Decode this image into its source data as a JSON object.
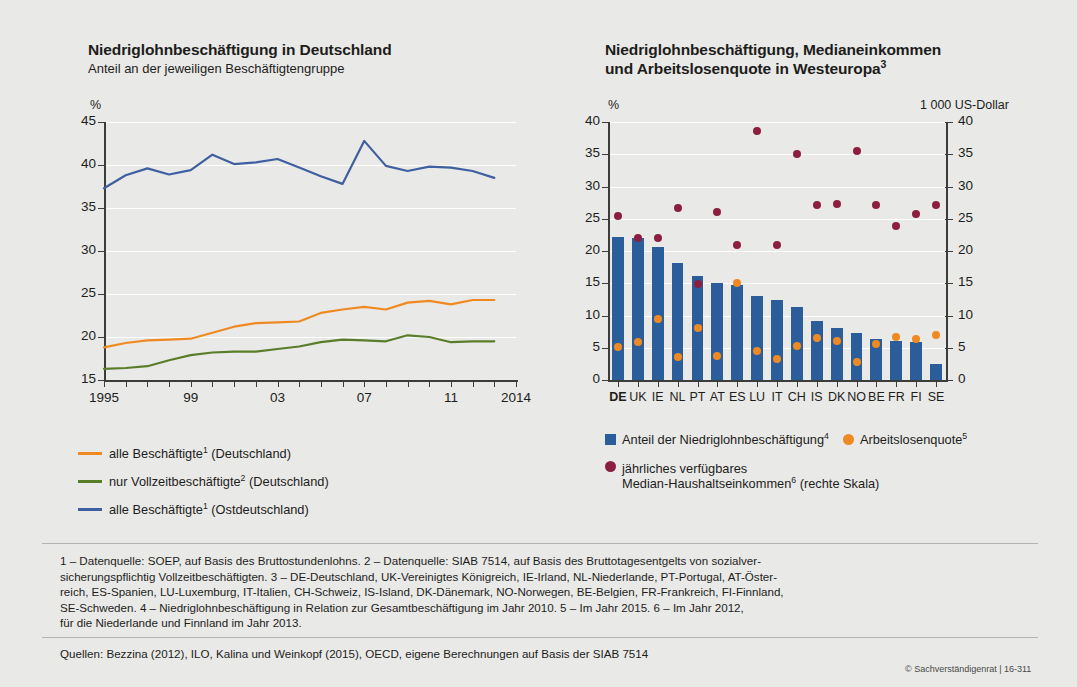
{
  "left_chart": {
    "title": "Niedriglohnbeschäftigung in Deutschland",
    "subtitle": "Anteil an der jeweiligen Beschäftigtengruppe",
    "unit": "%",
    "legend": [
      {
        "label_pre": "alle Beschäftigte",
        "sup": "1",
        "label_post": " (Deutschland)",
        "color": "#ef8a22"
      },
      {
        "label_pre": "nur Vollzeitbeschäftigte",
        "sup": "2",
        "label_post": " (Deutschland)",
        "color": "#5a7d2a"
      },
      {
        "label_pre": "alle Beschäftigte",
        "sup": "1",
        "label_post": " (Ostdeutschland)",
        "color": "#3f5fa0"
      }
    ]
  },
  "right_chart": {
    "title_line1": "Niedriglohnbeschäftigung, Medianeinkommen",
    "title_line2_pre": "und Arbeitslosenquote in Westeuropa",
    "title_line2_sup": "3",
    "unit_left": "%",
    "unit_right": "1 000 US-Dollar",
    "legend": [
      {
        "label_pre": "Anteil der Niedriglohnbeschäftigung",
        "sup": "4",
        "label_post": "",
        "color": "#2c5d9b",
        "shape": "square"
      },
      {
        "label_pre": "Arbeitslosenquote",
        "sup": "5",
        "label_post": "",
        "color": "#ef8a22",
        "shape": "dot"
      },
      {
        "label_pre": "jährliches verfügbares",
        "label_line2_pre": "Median-Haushaltseinkommen",
        "sup": "6",
        "label_post": " (rechte Skala)",
        "color": "#8c1f3f",
        "shape": "dot"
      }
    ]
  },
  "footnotes": [
    "1 – Datenquelle: SOEP, auf Basis des Bruttostundenlohns.  2 – Datenquelle: SIAB 7514, auf Basis des Bruttotagesentgelts von sozialver-",
    "sicherungspflichtig Vollzeitbeschäftigten.  3 – DE-Deutschland, UK-Vereinigtes Königreich, IE-Irland, NL-Niederlande, PT-Portugal, AT-Öster-",
    "reich, ES-Spanien, LU-Luxemburg, IT-Italien, CH-Schweiz,  IS-Island, DK-Dänemark, NO-Norwegen, BE-Belgien, FR-Frankreich, FI-Finnland,",
    "SE-Schweden.  4 – Niedriglohnbeschäftigung in Relation zur Gesamtbeschäftigung im Jahr 2010.  5 – Im Jahr 2015.  6 – Im Jahr 2012,",
    "für die Niederlande und Finnland im Jahr 2013."
  ],
  "sources": "Quellen: Bezzina (2012), ILO, Kalina und Weinkopf (2015), OECD, eigene Berechnungen auf Basis der SIAB 7514",
  "copyright": "© Sachverständigenrat | 16-311",
  "chart_data": [
    {
      "id": "left",
      "type": "line",
      "title": "Niedriglohnbeschäftigung in Deutschland",
      "subtitle": "Anteil an der jeweiligen Beschäftigtengruppe",
      "xlabel": "",
      "ylabel": "%",
      "ylim": [
        15,
        45
      ],
      "yticks": [
        15,
        20,
        25,
        30,
        35,
        40,
        45
      ],
      "grid": true,
      "legend_position": "below",
      "x": [
        1995,
        1996,
        1997,
        1998,
        1999,
        2000,
        2001,
        2002,
        2003,
        2004,
        2005,
        2006,
        2007,
        2008,
        2009,
        2010,
        2011,
        2012,
        2013
      ],
      "xticklabels": {
        "1995": "1995",
        "1999": "99",
        "2003": "03",
        "2007": "07",
        "2011": "11",
        "2014": "2014"
      },
      "series": [
        {
          "name": "alle Beschäftigte (Deutschland)",
          "color": "#ef8a22",
          "values": [
            18.8,
            19.3,
            19.6,
            19.7,
            19.8,
            20.5,
            21.2,
            21.6,
            21.7,
            21.8,
            22.8,
            23.2,
            23.5,
            23.2,
            24.0,
            24.2,
            23.8,
            24.3,
            24.3
          ]
        },
        {
          "name": "nur Vollzeitbeschäftigte (Deutschland)",
          "color": "#5a7d2a",
          "values": [
            16.3,
            16.4,
            16.6,
            17.3,
            17.9,
            18.2,
            18.3,
            18.3,
            18.6,
            18.9,
            19.4,
            19.7,
            19.6,
            19.5,
            20.2,
            20.0,
            19.4,
            19.5,
            19.5
          ]
        },
        {
          "name": "alle Beschäftigte (Ostdeutschland)",
          "color": "#3f5fa0",
          "values": [
            37.3,
            38.8,
            39.6,
            38.9,
            39.4,
            41.2,
            40.1,
            40.3,
            40.7,
            39.7,
            38.7,
            37.8,
            42.8,
            39.9,
            39.3,
            39.8,
            39.7,
            39.3,
            38.5
          ]
        }
      ]
    },
    {
      "id": "right",
      "type": "bar",
      "title": "Niedriglohnbeschäftigung, Medianeinkommen und Arbeitslosenquote in Westeuropa",
      "ylabel_left": "%",
      "ylabel_right": "1 000 US-Dollar",
      "ylim": [
        0,
        40
      ],
      "yticks": [
        0,
        5,
        10,
        15,
        20,
        25,
        30,
        35,
        40
      ],
      "ylim_right": [
        0,
        40
      ],
      "yticks_right": [
        0,
        5,
        10,
        15,
        20,
        25,
        30,
        35,
        40
      ],
      "grid": true,
      "legend_position": "below",
      "categories": [
        "DE",
        "UK",
        "IE",
        "NL",
        "PT",
        "AT",
        "ES",
        "LU",
        "IT",
        "CH",
        "IS",
        "DK",
        "NO",
        "BE",
        "FR",
        "FI",
        "SE"
      ],
      "highlight_category": "DE",
      "series": [
        {
          "name": "Anteil der Niedriglohnbeschäftigung",
          "type": "bar",
          "color": "#2c5d9b",
          "values": [
            22.2,
            22.1,
            20.7,
            18.1,
            16.1,
            15.0,
            14.7,
            13.1,
            12.4,
            11.3,
            9.1,
            8.0,
            7.3,
            6.4,
            6.1,
            5.9,
            2.5
          ]
        },
        {
          "name": "Arbeitslosenquote",
          "type": "scatter",
          "color": "#ef8a22",
          "values": [
            5.2,
            5.9,
            9.5,
            3.5,
            8.0,
            3.7,
            15.0,
            4.5,
            3.2,
            5.3,
            6.5,
            6.0,
            2.8,
            5.6,
            6.6,
            6.4,
            7.0
          ]
        },
        {
          "name": "jährliches verfügbares Median-Haushaltseinkommen (rechte Skala)",
          "type": "scatter",
          "color": "#8c1f3f",
          "axis": "right",
          "values": [
            25.5,
            22.0,
            22.0,
            26.6,
            14.9,
            26.0,
            20.9,
            38.6,
            21.0,
            35.1,
            27.1,
            27.3,
            35.5,
            27.2,
            23.9,
            25.7,
            27.1
          ]
        }
      ]
    }
  ]
}
